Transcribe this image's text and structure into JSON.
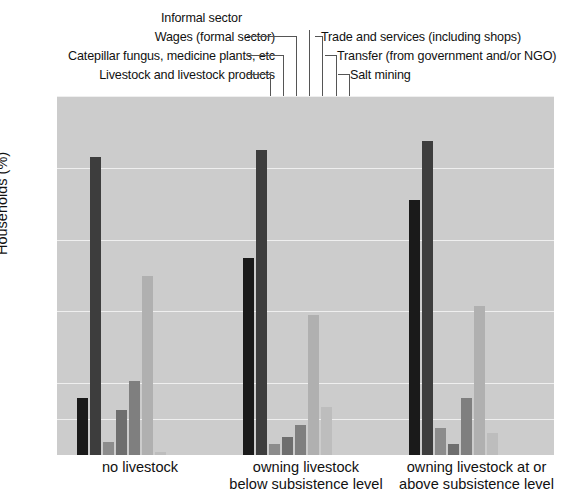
{
  "chart_data": {
    "type": "bar",
    "title": "",
    "xlabel": "",
    "ylabel": "Households (%)",
    "ylim": [
      0,
      100
    ],
    "yticks": [
      0,
      10,
      20,
      40,
      60,
      80,
      100
    ],
    "ytick_labels": [
      "0",
      "10",
      "20",
      "40",
      "60",
      "80",
      "100"
    ],
    "grid": true,
    "legend_position": "callout-labels-above-plot",
    "categories": [
      "no livestock",
      "owning livestock below subsistence level",
      "owning livestock at or above subsistence level"
    ],
    "category_lines": [
      [
        "no livestock"
      ],
      [
        "owning livestock",
        "below subsistence level"
      ],
      [
        "owning livestock at or",
        "above subsistence level"
      ]
    ],
    "series": [
      {
        "name": "Livestock and livestock products",
        "color": "#1a1a1a",
        "values": [
          16,
          55,
          71
        ]
      },
      {
        "name": "Catepillar fungus, medicine plants, etc",
        "color": "#3d3d3d",
        "values": [
          83,
          85,
          87.5
        ]
      },
      {
        "name": "Wages (formal sector)",
        "color": "#8c8c8c",
        "values": [
          3.5,
          3,
          7.5
        ]
      },
      {
        "name": "Informal sector",
        "color": "#6e6e6e",
        "values": [
          12.5,
          5,
          3
        ]
      },
      {
        "name": "Trade and services (including shops)",
        "color": "#7f7f7f",
        "values": [
          20.5,
          8.5,
          16
        ]
      },
      {
        "name": "Transfer (from government and/or NGO)",
        "color": "#b0b0b0",
        "values": [
          50,
          39,
          41.5
        ]
      },
      {
        "name": "Salt mining",
        "color": "#bdbdbd",
        "values": [
          0.8,
          13.5,
          6
        ]
      }
    ]
  },
  "callouts": [
    {
      "text": "Livestock and livestock products",
      "align": "right"
    },
    {
      "text": "Catepillar fungus, medicine plants, etc",
      "align": "right"
    },
    {
      "text": "Wages (formal sector)",
      "align": "right"
    },
    {
      "text": "Informal sector",
      "align": "center"
    },
    {
      "text": "Trade and services (including shops)",
      "align": "left"
    },
    {
      "text": "Transfer (from government and/or NGO)",
      "align": "left"
    },
    {
      "text": "Salt mining",
      "align": "left"
    }
  ],
  "axis": {
    "y_title": "Households (%)"
  },
  "colors": {
    "plot_background": "#cccccc",
    "gridline": "#efefef",
    "page_background": "#ffffff",
    "text": "#111111",
    "leader_line": "#555555"
  }
}
